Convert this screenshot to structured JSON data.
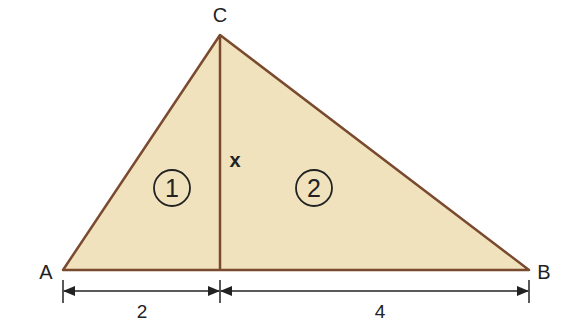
{
  "figure": {
    "vertices": {
      "A": "A",
      "B": "B",
      "C": "C"
    },
    "altitude_label": "x",
    "region_labels": [
      "1",
      "2"
    ],
    "dimensions": [
      {
        "segment": "A to foot of altitude",
        "value": "2"
      },
      {
        "segment": "foot of altitude to B",
        "value": "4"
      }
    ],
    "colors": {
      "fill": "#efe2bd",
      "stroke": "#7a4a2e",
      "text": "#222222"
    }
  }
}
